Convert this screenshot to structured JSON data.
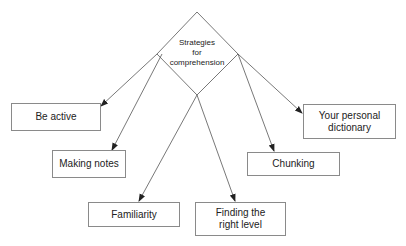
{
  "center": {
    "label_lines": [
      "Strategies",
      "for",
      "comprehension"
    ]
  },
  "nodes": [
    {
      "id": "be-active",
      "label": "Be active"
    },
    {
      "id": "making-notes",
      "label": "Making notes"
    },
    {
      "id": "familiarity",
      "label": "Familiarity"
    },
    {
      "id": "finding-right-level",
      "label_lines": [
        "Finding the",
        "right level"
      ]
    },
    {
      "id": "chunking",
      "label": "Chunking"
    },
    {
      "id": "personal-dictionary",
      "label_lines": [
        "Your personal",
        "dictionary"
      ]
    }
  ],
  "colors": {
    "line": "#555555",
    "border": "#8a8a8a",
    "text": "#222222"
  }
}
